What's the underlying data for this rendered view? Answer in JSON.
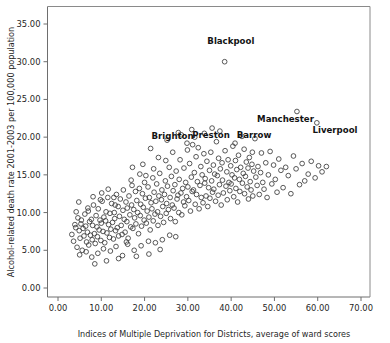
{
  "chart_data": {
    "type": "scatter",
    "title": "",
    "xlabel": "Indices of Multiple Deprivation for Districts, average of ward scores",
    "ylabel": "Alcohol-related death rate 2001-2003 per 100,000 population",
    "xlim": [
      -2.0,
      73.0
    ],
    "ylim": [
      -1.0,
      36.8
    ],
    "xticks": [
      0,
      10,
      20,
      30,
      40,
      50,
      60,
      70
    ],
    "xtick_labels": [
      "0.00",
      "10.00",
      "20.00",
      "30.00",
      "40.00",
      "50.00",
      "60.00",
      "70.00"
    ],
    "yticks": [
      0,
      5,
      10,
      15,
      20,
      25,
      30,
      35
    ],
    "ytick_labels": [
      "0.00",
      "5.00",
      "10.00",
      "15.00",
      "20.00",
      "25.00",
      "30.00",
      "35.00"
    ],
    "grid": false,
    "legend": null,
    "marker": "open-circle",
    "marker_color": "#3b3b3b",
    "annotations": [
      {
        "label": "Blackpool",
        "x": 38.5,
        "y": 30.0,
        "dx": -4.0,
        "dy": 2.4
      },
      {
        "label": "Brighton",
        "x": 27.8,
        "y": 20.6,
        "dx": -6.2,
        "dy": -0.9
      },
      {
        "label": "Preston",
        "x": 36.6,
        "y": 19.4,
        "dx": -5.6,
        "dy": 0.55
      },
      {
        "label": "Barrow",
        "x": 42.5,
        "y": 20.1,
        "dx": -1.2,
        "dy": -0.15
      },
      {
        "label": "Manchester",
        "x": 55.2,
        "y": 23.4,
        "dx": -9.2,
        "dy": -1.45
      },
      {
        "label": "Liverpool",
        "x": 59.8,
        "y": 21.9,
        "dx": -1.0,
        "dy": -1.35
      }
    ],
    "points": [
      [
        3.2,
        7.1
      ],
      [
        3.6,
        6.2
      ],
      [
        4.1,
        8.0
      ],
      [
        4.4,
        5.4
      ],
      [
        4.6,
        9.3
      ],
      [
        4.9,
        7.6
      ],
      [
        5.1,
        6.6
      ],
      [
        5.3,
        8.5
      ],
      [
        5.6,
        5.0
      ],
      [
        5.8,
        7.9
      ],
      [
        6.0,
        6.9
      ],
      [
        6.2,
        9.8
      ],
      [
        6.4,
        8.2
      ],
      [
        6.6,
        6.1
      ],
      [
        6.8,
        7.4
      ],
      [
        7.0,
        10.2
      ],
      [
        7.1,
        5.7
      ],
      [
        7.3,
        8.8
      ],
      [
        7.5,
        7.0
      ],
      [
        7.7,
        9.1
      ],
      [
        7.9,
        6.4
      ],
      [
        8.0,
        8.3
      ],
      [
        8.2,
        11.0
      ],
      [
        8.4,
        7.2
      ],
      [
        8.6,
        5.9
      ],
      [
        8.8,
        9.6
      ],
      [
        9.0,
        8.1
      ],
      [
        9.1,
        6.8
      ],
      [
        9.3,
        10.5
      ],
      [
        9.5,
        7.7
      ],
      [
        9.7,
        9.0
      ],
      [
        9.9,
        6.3
      ],
      [
        10.0,
        8.6
      ],
      [
        10.2,
        11.5
      ],
      [
        10.4,
        7.5
      ],
      [
        10.6,
        9.4
      ],
      [
        10.8,
        6.0
      ],
      [
        11.0,
        8.9
      ],
      [
        11.1,
        10.1
      ],
      [
        11.3,
        7.3
      ],
      [
        11.5,
        12.0
      ],
      [
        11.7,
        8.4
      ],
      [
        11.9,
        6.7
      ],
      [
        12.0,
        9.9
      ],
      [
        12.2,
        7.8
      ],
      [
        12.4,
        11.2
      ],
      [
        12.6,
        8.7
      ],
      [
        12.8,
        6.5
      ],
      [
        13.0,
        10.0
      ],
      [
        13.1,
        9.2
      ],
      [
        13.3,
        7.6
      ],
      [
        13.5,
        12.4
      ],
      [
        13.7,
        8.0
      ],
      [
        13.9,
        10.8
      ],
      [
        14.0,
        6.9
      ],
      [
        14.2,
        9.5
      ],
      [
        14.4,
        11.8
      ],
      [
        14.6,
        8.3
      ],
      [
        14.8,
        7.1
      ],
      [
        15.0,
        10.3
      ],
      [
        15.1,
        13.0
      ],
      [
        15.3,
        9.1
      ],
      [
        15.5,
        7.4
      ],
      [
        15.7,
        11.4
      ],
      [
        15.9,
        8.8
      ],
      [
        16.0,
        10.6
      ],
      [
        16.2,
        6.6
      ],
      [
        16.4,
        12.2
      ],
      [
        16.6,
        9.7
      ],
      [
        16.8,
        8.1
      ],
      [
        17.0,
        11.0
      ],
      [
        17.1,
        13.6
      ],
      [
        17.3,
        7.9
      ],
      [
        17.5,
        10.4
      ],
      [
        17.7,
        9.3
      ],
      [
        17.9,
        12.8
      ],
      [
        18.0,
        8.5
      ],
      [
        18.2,
        11.6
      ],
      [
        18.4,
        10.0
      ],
      [
        18.6,
        7.2
      ],
      [
        18.8,
        13.2
      ],
      [
        19.0,
        9.6
      ],
      [
        19.1,
        11.1
      ],
      [
        19.3,
        8.2
      ],
      [
        19.5,
        12.5
      ],
      [
        19.7,
        10.7
      ],
      [
        19.9,
        9.0
      ],
      [
        20.0,
        14.0
      ],
      [
        20.2,
        11.9
      ],
      [
        20.4,
        8.6
      ],
      [
        20.6,
        10.2
      ],
      [
        20.8,
        13.4
      ],
      [
        21.0,
        9.4
      ],
      [
        21.1,
        12.0
      ],
      [
        21.3,
        7.7
      ],
      [
        21.5,
        11.3
      ],
      [
        21.7,
        10.5
      ],
      [
        21.9,
        14.6
      ],
      [
        22.0,
        8.9
      ],
      [
        22.2,
        12.7
      ],
      [
        22.4,
        9.8
      ],
      [
        22.6,
        11.5
      ],
      [
        22.8,
        13.8
      ],
      [
        23.0,
        10.1
      ],
      [
        23.1,
        8.3
      ],
      [
        23.3,
        12.2
      ],
      [
        23.5,
        15.2
      ],
      [
        23.7,
        9.5
      ],
      [
        23.9,
        11.7
      ],
      [
        24.0,
        13.0
      ],
      [
        24.2,
        10.8
      ],
      [
        24.4,
        8.7
      ],
      [
        24.6,
        12.4
      ],
      [
        24.8,
        14.2
      ],
      [
        25.0,
        9.9
      ],
      [
        25.1,
        11.2
      ],
      [
        25.3,
        13.5
      ],
      [
        25.5,
        10.4
      ],
      [
        25.7,
        16.0
      ],
      [
        25.9,
        12.0
      ],
      [
        26.0,
        9.2
      ],
      [
        26.2,
        14.8
      ],
      [
        26.4,
        11.0
      ],
      [
        26.6,
        12.9
      ],
      [
        26.8,
        10.6
      ],
      [
        27.0,
        13.7
      ],
      [
        27.1,
        8.8
      ],
      [
        27.3,
        15.5
      ],
      [
        27.5,
        11.8
      ],
      [
        27.7,
        12.3
      ],
      [
        27.8,
        20.6
      ],
      [
        27.9,
        10.0
      ],
      [
        28.0,
        14.4
      ],
      [
        28.2,
        17.0
      ],
      [
        28.4,
        12.6
      ],
      [
        28.6,
        9.7
      ],
      [
        28.8,
        13.2
      ],
      [
        29.0,
        11.4
      ],
      [
        29.1,
        15.9
      ],
      [
        29.3,
        10.9
      ],
      [
        29.5,
        14.0
      ],
      [
        29.7,
        12.1
      ],
      [
        29.9,
        18.3
      ],
      [
        30.0,
        13.4
      ],
      [
        30.2,
        11.6
      ],
      [
        30.4,
        16.5
      ],
      [
        30.6,
        10.2
      ],
      [
        30.8,
        14.7
      ],
      [
        31.0,
        12.8
      ],
      [
        31.1,
        19.0
      ],
      [
        31.3,
        13.0
      ],
      [
        31.5,
        15.3
      ],
      [
        31.7,
        11.1
      ],
      [
        31.9,
        17.4
      ],
      [
        32.0,
        12.4
      ],
      [
        32.2,
        14.1
      ],
      [
        32.4,
        18.6
      ],
      [
        32.6,
        10.5
      ],
      [
        32.8,
        13.6
      ],
      [
        33.0,
        16.1
      ],
      [
        33.1,
        12.0
      ],
      [
        33.3,
        15.0
      ],
      [
        33.5,
        11.3
      ],
      [
        33.7,
        17.8
      ],
      [
        33.9,
        13.9
      ],
      [
        34.0,
        14.5
      ],
      [
        34.2,
        12.2
      ],
      [
        34.4,
        16.8
      ],
      [
        34.6,
        10.8
      ],
      [
        34.8,
        13.3
      ],
      [
        35.0,
        15.6
      ],
      [
        35.1,
        11.9
      ],
      [
        35.3,
        18.0
      ],
      [
        35.5,
        14.2
      ],
      [
        35.7,
        12.7
      ],
      [
        35.9,
        16.3
      ],
      [
        36.0,
        13.1
      ],
      [
        36.2,
        15.1
      ],
      [
        36.4,
        11.5
      ],
      [
        36.6,
        19.4
      ],
      [
        36.8,
        14.9
      ],
      [
        37.0,
        12.3
      ],
      [
        37.1,
        17.2
      ],
      [
        37.3,
        13.7
      ],
      [
        37.5,
        15.8
      ],
      [
        37.7,
        11.0
      ],
      [
        37.9,
        16.6
      ],
      [
        38.0,
        14.3
      ],
      [
        38.2,
        12.6
      ],
      [
        38.5,
        30.0
      ],
      [
        38.6,
        18.2
      ],
      [
        38.8,
        13.5
      ],
      [
        39.0,
        15.4
      ],
      [
        39.1,
        11.7
      ],
      [
        39.3,
        17.0
      ],
      [
        39.5,
        14.0
      ],
      [
        39.7,
        12.9
      ],
      [
        39.9,
        16.2
      ],
      [
        40.0,
        13.8
      ],
      [
        40.2,
        15.0
      ],
      [
        40.4,
        18.8
      ],
      [
        40.6,
        12.1
      ],
      [
        40.8,
        14.6
      ],
      [
        41.0,
        16.9
      ],
      [
        41.1,
        13.2
      ],
      [
        41.3,
        15.7
      ],
      [
        41.5,
        11.4
      ],
      [
        41.7,
        17.6
      ],
      [
        41.9,
        14.4
      ],
      [
        42.0,
        12.8
      ],
      [
        42.2,
        16.0
      ],
      [
        42.5,
        20.1
      ],
      [
        42.6,
        13.9
      ],
      [
        42.8,
        15.2
      ],
      [
        43.0,
        18.4
      ],
      [
        43.1,
        12.5
      ],
      [
        43.3,
        14.8
      ],
      [
        43.5,
        16.7
      ],
      [
        43.7,
        13.4
      ],
      [
        43.9,
        15.9
      ],
      [
        44.0,
        11.8
      ],
      [
        44.2,
        17.3
      ],
      [
        44.4,
        14.1
      ],
      [
        44.6,
        13.0
      ],
      [
        44.8,
        16.4
      ],
      [
        45.0,
        12.2
      ],
      [
        45.2,
        15.5
      ],
      [
        45.5,
        19.8
      ],
      [
        45.7,
        14.7
      ],
      [
        46.0,
        13.6
      ],
      [
        46.2,
        16.1
      ],
      [
        46.5,
        12.4
      ],
      [
        46.8,
        15.3
      ],
      [
        47.0,
        17.9
      ],
      [
        47.3,
        14.0
      ],
      [
        47.6,
        13.1
      ],
      [
        48.0,
        16.6
      ],
      [
        48.3,
        12.0
      ],
      [
        48.6,
        15.0
      ],
      [
        49.0,
        18.1
      ],
      [
        49.4,
        13.8
      ],
      [
        49.8,
        16.3
      ],
      [
        50.2,
        14.4
      ],
      [
        50.6,
        12.7
      ],
      [
        51.0,
        17.1
      ],
      [
        51.5,
        15.6
      ],
      [
        52.0,
        13.3
      ],
      [
        52.6,
        16.0
      ],
      [
        53.2,
        14.9
      ],
      [
        53.8,
        12.5
      ],
      [
        54.4,
        17.5
      ],
      [
        55.2,
        23.4
      ],
      [
        55.0,
        15.8
      ],
      [
        55.8,
        13.7
      ],
      [
        56.4,
        16.5
      ],
      [
        57.0,
        14.2
      ],
      [
        57.8,
        15.1
      ],
      [
        58.5,
        16.8
      ],
      [
        59.8,
        21.9
      ],
      [
        59.4,
        14.6
      ],
      [
        60.2,
        16.2
      ],
      [
        61.0,
        15.4
      ],
      [
        62.0,
        16.1
      ],
      [
        5.0,
        4.4
      ],
      [
        6.5,
        4.8
      ],
      [
        7.8,
        4.1
      ],
      [
        9.2,
        4.6
      ],
      [
        10.5,
        5.2
      ],
      [
        12.1,
        4.9
      ],
      [
        13.4,
        5.5
      ],
      [
        14.9,
        4.3
      ],
      [
        16.1,
        5.8
      ],
      [
        17.6,
        5.0
      ],
      [
        19.2,
        5.6
      ],
      [
        20.9,
        6.2
      ],
      [
        22.5,
        6.0
      ],
      [
        24.1,
        6.4
      ],
      [
        25.8,
        7.0
      ],
      [
        27.2,
        6.8
      ],
      [
        11.2,
        3.6
      ],
      [
        14.0,
        3.9
      ],
      [
        18.1,
        4.2
      ],
      [
        21.0,
        4.5
      ],
      [
        23.6,
        5.1
      ],
      [
        8.5,
        3.2
      ],
      [
        12.9,
        12.0
      ],
      [
        15.8,
        6.1
      ],
      [
        9.8,
        11.7
      ],
      [
        11.6,
        13.1
      ],
      [
        13.2,
        11.0
      ],
      [
        6.9,
        10.6
      ],
      [
        8.1,
        12.1
      ],
      [
        10.1,
        12.6
      ],
      [
        16.9,
        14.3
      ],
      [
        18.9,
        15.1
      ],
      [
        20.3,
        14.9
      ],
      [
        22.1,
        15.8
      ],
      [
        19.6,
        16.4
      ],
      [
        17.2,
        16.0
      ],
      [
        24.9,
        16.9
      ],
      [
        23.2,
        17.3
      ],
      [
        26.5,
        18.0
      ],
      [
        21.4,
        18.5
      ],
      [
        29.8,
        19.2
      ],
      [
        31.6,
        20.0
      ],
      [
        25.2,
        19.6
      ],
      [
        28.5,
        20.3
      ],
      [
        30.9,
        21.0
      ],
      [
        33.8,
        20.5
      ],
      [
        35.6,
        21.2
      ],
      [
        37.4,
        20.8
      ],
      [
        40.9,
        19.2
      ],
      [
        44.9,
        18.0
      ],
      [
        4.2,
        10.1
      ],
      [
        5.4,
        9.0
      ],
      [
        3.9,
        8.4
      ],
      [
        4.8,
        11.4
      ]
    ]
  }
}
